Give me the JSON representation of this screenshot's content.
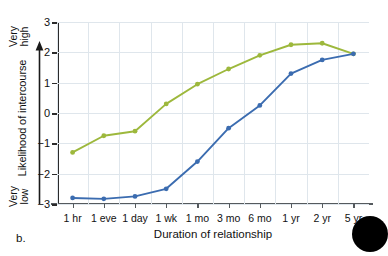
{
  "figure": {
    "panel_label": "b.",
    "corner_marker": "black-circle"
  },
  "chart_data": {
    "type": "line",
    "title": "",
    "xlabel": "Duration of relationship",
    "ylabel": "Likelihood of intercourse",
    "categories": [
      "1 hr",
      "1 eve",
      "1 day",
      "1 wk",
      "1 mo",
      "3 mo",
      "6 mo",
      "1 yr",
      "2 yr",
      "5 yr"
    ],
    "ylim": [
      -3,
      3
    ],
    "yticks": [
      3,
      2,
      1,
      0,
      -1,
      -2,
      -3
    ],
    "ytick_labels": [
      "3",
      "2",
      "1",
      "0",
      "−1",
      "−2",
      "−3"
    ],
    "y_axis_high_label": [
      "Very",
      "high"
    ],
    "y_axis_low_label": [
      "Very",
      "low"
    ],
    "grid": true,
    "legend": "none",
    "series": [
      {
        "name": "Men",
        "color": "#9db83c",
        "values": [
          -1.3,
          -0.75,
          -0.6,
          0.3,
          0.95,
          1.45,
          1.9,
          2.25,
          2.3,
          1.95
        ]
      },
      {
        "name": "Women",
        "color": "#3b6cb0",
        "values": [
          -2.8,
          -2.83,
          -2.75,
          -2.5,
          -1.6,
          -0.5,
          0.25,
          1.3,
          1.75,
          1.95
        ]
      }
    ]
  },
  "colors": {
    "green_series": "#9db83c",
    "blue_series": "#3b6cb0",
    "gridline": "#dfe6ec",
    "axis": "#2b2b2b",
    "background": "#ffffff"
  }
}
